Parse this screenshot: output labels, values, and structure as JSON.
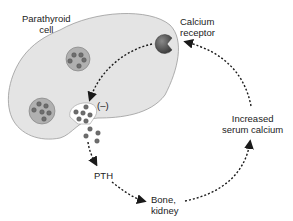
{
  "diagram": {
    "labels": {
      "cell_line1": "Parathyroid",
      "cell_line2": "cell",
      "receptor_line1": "Calcium",
      "receptor_line2": "receptor",
      "inhibition": "(–)",
      "pth": "PTH",
      "target_line1": "Bone,",
      "target_line2": "kidney",
      "result_line1": "Increased",
      "result_line2": "serum calcium"
    },
    "colors": {
      "cell_fill": "#e4e4e4",
      "cell_stroke": "#9a9a9a",
      "vesicle_fill": "#b0b0b0",
      "granule_fill": "#6e6e6e",
      "receptor_fill": "#555555",
      "arrow": "#1a1a1a",
      "text": "#222222"
    },
    "flow": [
      {
        "from": "Increased serum calcium",
        "to": "Calcium receptor"
      },
      {
        "from": "Calcium receptor",
        "to": "Secretory vesicle",
        "effect": "(–)"
      },
      {
        "from": "Parathyroid cell",
        "to": "PTH"
      },
      {
        "from": "PTH",
        "to": "Bone, kidney"
      },
      {
        "from": "Bone, kidney",
        "to": "Increased serum calcium"
      }
    ]
  }
}
